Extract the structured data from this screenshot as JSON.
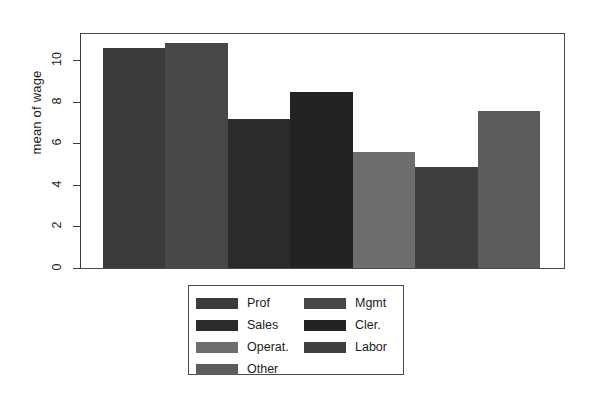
{
  "chart_data": {
    "type": "bar",
    "title": "",
    "xlabel": "",
    "ylabel": "mean of wage",
    "ylim": [
      0,
      11.5
    ],
    "yticks": [
      0,
      2,
      4,
      6,
      8,
      10
    ],
    "ytick_labels": [
      "0",
      "2",
      "4",
      "6",
      "8",
      "10"
    ],
    "grid": true,
    "grid_axis": "y",
    "legend_position": "bottom-center",
    "legend_columns": 2,
    "categories": [
      "Prof",
      "Mgmt",
      "Sales",
      "Cler.",
      "Operat.",
      "Labor",
      "Other"
    ],
    "values": [
      10.6,
      10.8,
      7.15,
      8.45,
      5.6,
      4.85,
      7.55
    ],
    "colors": [
      "#3b3b3b",
      "#474747",
      "#2b2b2b",
      "#232323",
      "#6e6e6e",
      "#3f3f3f",
      "#5c5c5c"
    ],
    "bars": [
      {
        "label": "Prof",
        "value": 10.6,
        "color": "#3b3b3b"
      },
      {
        "label": "Mgmt",
        "value": 10.8,
        "color": "#474747"
      },
      {
        "label": "Sales",
        "value": 7.15,
        "color": "#2b2b2b"
      },
      {
        "label": "Cler.",
        "value": 8.45,
        "color": "#232323"
      },
      {
        "label": "Operat.",
        "value": 5.6,
        "color": "#6e6e6e"
      },
      {
        "label": "Labor",
        "value": 4.85,
        "color": "#3f3f3f"
      },
      {
        "label": "Other",
        "value": 7.55,
        "color": "#5c5c5c"
      }
    ]
  },
  "axis": {
    "y_label": "mean of wage",
    "y_tick_0": "0",
    "y_tick_1": "2",
    "y_tick_2": "4",
    "y_tick_3": "6",
    "y_tick_4": "8",
    "y_tick_5": "10"
  },
  "legend": {
    "left_column": [
      {
        "label": "Prof",
        "color": "#3b3b3b"
      },
      {
        "label": "Sales",
        "color": "#2b2b2b"
      },
      {
        "label": "Operat.",
        "color": "#6e6e6e"
      },
      {
        "label": "Other",
        "color": "#5c5c5c"
      }
    ],
    "right_column": [
      {
        "label": "Mgmt",
        "color": "#474747"
      },
      {
        "label": "Cler.",
        "color": "#232323"
      },
      {
        "label": "Labor",
        "color": "#3f3f3f"
      }
    ]
  },
  "theme": {
    "background": "#ffffff",
    "axis_color": "#3c3c3c",
    "grid_color": "#ececec",
    "text_color": "#1c1c1c"
  }
}
